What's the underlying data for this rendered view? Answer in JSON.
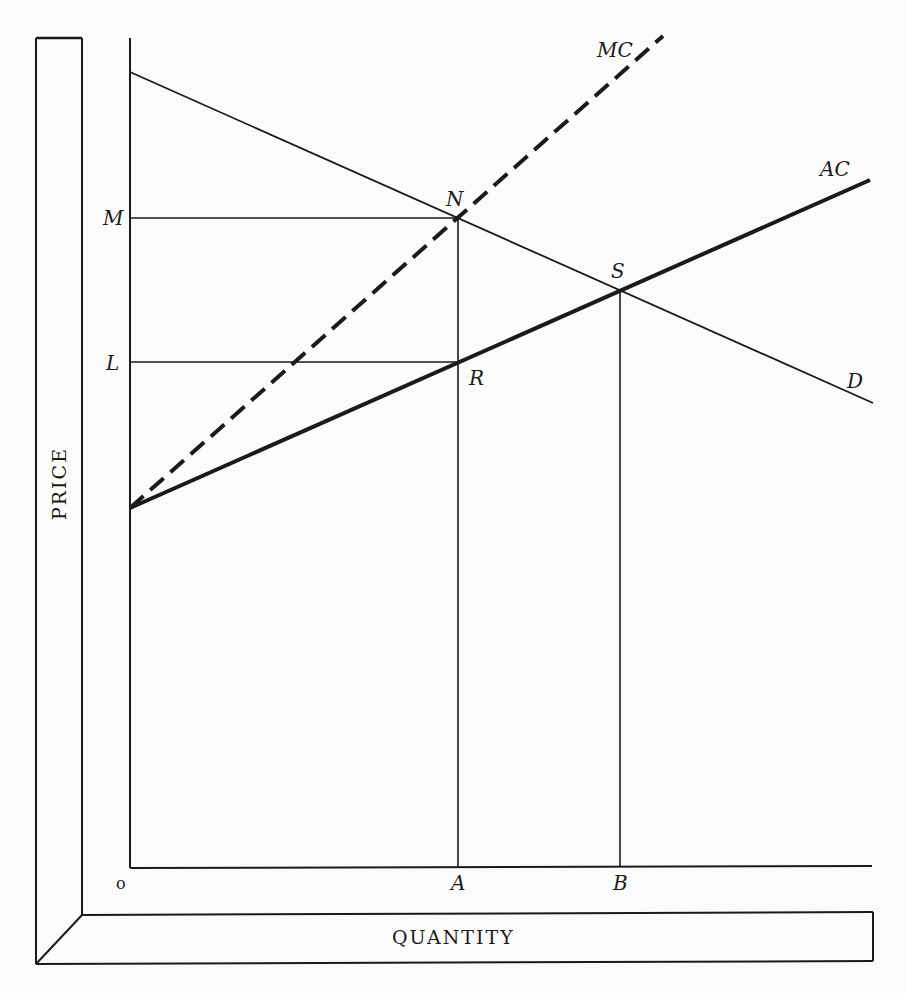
{
  "diagram": {
    "axes": {
      "y_title": "PRICE",
      "x_title": "QUANTITY",
      "origin_label": "o"
    },
    "curves": {
      "demand": {
        "label": "D",
        "style": "thin solid"
      },
      "average_cost": {
        "label": "AC",
        "style": "thick solid"
      },
      "marginal_cost": {
        "label": "MC",
        "style": "thick dashed"
      }
    },
    "points": {
      "N": "N",
      "S": "S",
      "R": "R"
    },
    "y_labels": {
      "M": "M",
      "L": "L"
    },
    "x_labels": {
      "A": "A",
      "B": "B"
    },
    "colors": {
      "ink": "#1a1a1a",
      "paper": "#fbfbfa"
    }
  }
}
